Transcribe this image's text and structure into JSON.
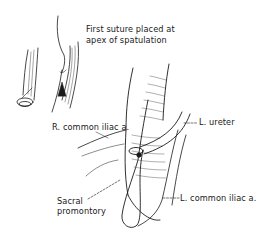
{
  "figure": {
    "labels": {
      "first_suture_line1": "First suture placed at",
      "first_suture_line2": "apex of spatulation",
      "l_ureter": "L. ureter",
      "r_common_iliac": "R. common iliac a.",
      "sacral_line1": "Sacral",
      "sacral_line2": "promontory",
      "l_common_iliac": "L. common iliac a."
    },
    "colors": {
      "ink": "#1a1a1a",
      "background": "#ffffff"
    }
  }
}
